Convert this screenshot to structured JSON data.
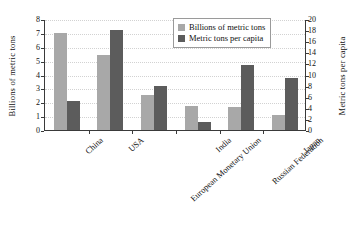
{
  "chart_data": {
    "type": "bar",
    "title": "",
    "xlabel": "",
    "ylabel": "Billions of metric tons",
    "y2label": "Metric tons per capita",
    "ylim": [
      0,
      8
    ],
    "y2lim": [
      0,
      20
    ],
    "yticks": [
      "8",
      "7",
      "6",
      "5",
      "4",
      "3",
      "2",
      "1",
      "0"
    ],
    "y2ticks": [
      "20",
      "18",
      "16",
      "14",
      "12",
      "10",
      "8",
      "6",
      "4",
      "2",
      "0"
    ],
    "grid": true,
    "legend_position": "top-right",
    "categories": [
      "China",
      "USA",
      "European Monetary Union",
      "India",
      "Russian Federation",
      "Japan"
    ],
    "series": [
      {
        "name": "Billions of metric tons",
        "axis": "left",
        "color": "#a8a8a8",
        "values": [
          7.0,
          5.4,
          2.5,
          1.7,
          1.65,
          1.1
        ]
      },
      {
        "name": "Metric tons per capita",
        "axis": "right",
        "color": "#5c5c5c",
        "values": [
          5.3,
          18.0,
          8.0,
          1.4,
          11.8,
          9.3
        ]
      }
    ]
  },
  "legend": {
    "items": [
      {
        "label": "Billions of metric tons",
        "swatch": "light"
      },
      {
        "label": "Metric tons per capita",
        "swatch": "dark"
      }
    ]
  }
}
